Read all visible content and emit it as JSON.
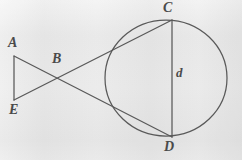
{
  "figure": {
    "kind": "geometry-diagram",
    "canvas": {
      "width": 242,
      "height": 160
    },
    "colors": {
      "background": "#f4f4f4",
      "stroke": "#595959",
      "label": "#4a4a4a"
    },
    "circle": {
      "name": "main-circle",
      "center_x": 166,
      "center_y": 78,
      "radius_x": 61,
      "radius_y": 58
    },
    "points": [
      {
        "id": "A",
        "label": "A",
        "x": 14,
        "y": 56,
        "label_x": 8,
        "label_y": 36
      },
      {
        "id": "B",
        "label": "B",
        "x": 57,
        "y": 78,
        "label_x": 52,
        "label_y": 52
      },
      {
        "id": "C",
        "label": "C",
        "x": 172,
        "y": 20,
        "label_x": 163,
        "label_y": 1
      },
      {
        "id": "D",
        "label": "D",
        "x": 172,
        "y": 137,
        "label_x": 164,
        "label_y": 140
      },
      {
        "id": "E",
        "label": "E",
        "x": 14,
        "y": 100,
        "label_x": 9,
        "label_y": 103
      }
    ],
    "segments": [
      {
        "name": "segment-AE",
        "from": "A",
        "to": "E"
      },
      {
        "name": "segment-A-to-D",
        "from": "A",
        "to": "D"
      },
      {
        "name": "segment-E-to-C",
        "from": "E",
        "to": "C"
      },
      {
        "name": "segment-CD-diameter",
        "from": "C",
        "to": "D"
      }
    ],
    "measure_labels": [
      {
        "id": "d",
        "label": "d",
        "label_x": 176,
        "label_y": 66
      }
    ]
  }
}
